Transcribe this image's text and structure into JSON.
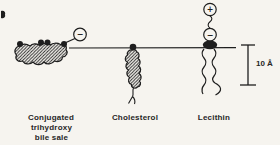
{
  "figure": {
    "type": "schematic-diagram"
  },
  "colors": {
    "background": "#f6f4ef",
    "ink": "#1e1e1e"
  },
  "molecules": {
    "bile_salt": {
      "label_line1": "Conjugated",
      "label_line2": "trihydroxy",
      "label_line3": "bile sale",
      "head_charge": "−"
    },
    "cholesterol": {
      "label": "Cholesterol"
    },
    "lecithin": {
      "label": "Lecithin",
      "outer_charge": "+",
      "inner_charge": "−"
    }
  },
  "scale_bar": {
    "label": "10 Å"
  }
}
